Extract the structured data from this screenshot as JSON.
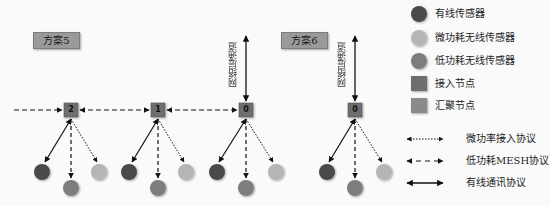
{
  "schemes": [
    {
      "label": "方案5"
    },
    {
      "label": "方案6"
    }
  ],
  "channel_label": "网络层通道",
  "nodes": [
    {
      "id": "2"
    },
    {
      "id": "1"
    },
    {
      "id": "0"
    },
    {
      "id": "0"
    }
  ],
  "legend": {
    "symbols": [
      {
        "label": "有线传感器",
        "shape": "circle",
        "color": "#4a4a4a"
      },
      {
        "label": "微功耗无线传感器",
        "shape": "circle",
        "color": "#b5b5b5"
      },
      {
        "label": "低功耗无线传感器",
        "shape": "circle",
        "color": "#7d7d7d"
      },
      {
        "label": "接入节点",
        "shape": "square",
        "color": "#6e6e6e"
      },
      {
        "label": "汇聚节点",
        "shape": "square",
        "color": "#8a8a8a"
      }
    ],
    "lines": [
      {
        "label": "微功率接入协议",
        "style": "dotted"
      },
      {
        "label": "低功耗MESH协议",
        "style": "dashed"
      },
      {
        "label": "有线通讯协议",
        "style": "solid"
      }
    ]
  },
  "colors": {
    "wired_sensor": "#4a4a4a",
    "micro_power_sensor": "#b5b5b5",
    "low_power_sensor": "#7d7d7d",
    "access_node": "#6e6e6e",
    "aggregation_node": "#8a8a8a",
    "line": "#111111"
  }
}
